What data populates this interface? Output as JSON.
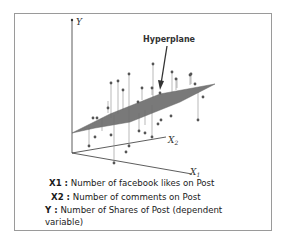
{
  "diagram": {
    "axes": {
      "y_label": "Y",
      "x1_label": "X1",
      "x2_label": "X2"
    },
    "annotation": "Hyperplane",
    "colors": {
      "plane": "#6e6e6e",
      "points": "#555555",
      "axes": "#333333",
      "border": "#9a9a9a"
    }
  },
  "legend": [
    {
      "key": "X1 :",
      "text": "Number of facebook likes on Post"
    },
    {
      "key": "X2 :",
      "text": "Number of comments on Post"
    },
    {
      "key": "Y :",
      "text": "Number of Shares of Post (dependent",
      "continuation": "variable)"
    }
  ]
}
